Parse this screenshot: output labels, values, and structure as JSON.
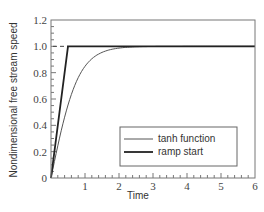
{
  "chart_data": {
    "type": "line",
    "title": "",
    "xlabel": "Time",
    "ylabel": "Nondimensional free stream speed",
    "xlim": [
      0,
      6
    ],
    "ylim": [
      0,
      1.2
    ],
    "x_ticks": [
      "1",
      "2",
      "3",
      "4",
      "5",
      "6"
    ],
    "x_zero_label": "",
    "y_ticks": [
      "0",
      "0.2",
      "0.4",
      "0.6",
      "0.8",
      "1.0",
      "1.2"
    ],
    "grid": false,
    "legend_position": "lower right",
    "reference_line": {
      "y": 1.0,
      "style": "dashed",
      "x_range": [
        0,
        0.5
      ]
    },
    "series": [
      {
        "name": "tanh function",
        "style": "thin",
        "color": "#555555",
        "x": [
          0,
          0.25,
          0.5,
          0.75,
          1.0,
          1.25,
          1.5,
          1.75,
          2.0,
          2.5,
          3.0,
          3.5,
          4.0,
          5.0,
          6.0
        ],
        "values": [
          0,
          0.3,
          0.54,
          0.71,
          0.82,
          0.89,
          0.93,
          0.96,
          0.975,
          0.99,
          0.997,
          1.0,
          1.0,
          1.0,
          1.0
        ]
      },
      {
        "name": "ramp start",
        "style": "thick",
        "color": "#222222",
        "x": [
          0,
          0.5,
          6.0
        ],
        "values": [
          0,
          1.0,
          1.0
        ]
      }
    ]
  },
  "legend": {
    "items": [
      {
        "label": "tanh function"
      },
      {
        "label": "ramp start"
      }
    ]
  },
  "axes": {
    "xlabel": "Time",
    "ylabel": "Nondimensional free stream speed"
  }
}
